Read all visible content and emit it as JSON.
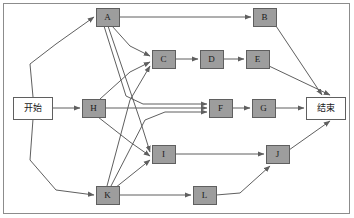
{
  "diagram": {
    "type": "directed-graph",
    "frame": {
      "x": 3,
      "y": 3,
      "width": 347,
      "height": 211,
      "stroke": "#8c8c8c",
      "fill": "#ffffff"
    },
    "style": {
      "task_fill": "#9d9d9d",
      "terminal_fill": "#ffffff",
      "node_stroke": "#5f5f5f",
      "edge_stroke": "#5f5f5f"
    },
    "nodes": [
      {
        "id": "start",
        "label": "开始",
        "kind": "terminal",
        "x": 13,
        "y": 97,
        "w": 39,
        "h": 22
      },
      {
        "id": "A",
        "label": "A",
        "kind": "task",
        "x": 96,
        "y": 8,
        "w": 23,
        "h": 18
      },
      {
        "id": "B",
        "label": "B",
        "kind": "task",
        "x": 253,
        "y": 8,
        "w": 23,
        "h": 18
      },
      {
        "id": "C",
        "label": "C",
        "kind": "task",
        "x": 152,
        "y": 50,
        "w": 23,
        "h": 18
      },
      {
        "id": "D",
        "label": "D",
        "kind": "task",
        "x": 200,
        "y": 50,
        "w": 23,
        "h": 18
      },
      {
        "id": "E",
        "label": "E",
        "kind": "task",
        "x": 246,
        "y": 50,
        "w": 23,
        "h": 18
      },
      {
        "id": "H",
        "label": "H",
        "kind": "task",
        "x": 82,
        "y": 99,
        "w": 23,
        "h": 18
      },
      {
        "id": "F",
        "label": "F",
        "kind": "task",
        "x": 209,
        "y": 99,
        "w": 23,
        "h": 18
      },
      {
        "id": "G",
        "label": "G",
        "kind": "task",
        "x": 252,
        "y": 99,
        "w": 23,
        "h": 18
      },
      {
        "id": "end",
        "label": "结束",
        "kind": "terminal",
        "x": 306,
        "y": 97,
        "w": 39,
        "h": 22
      },
      {
        "id": "I",
        "label": "I",
        "kind": "task",
        "x": 152,
        "y": 145,
        "w": 23,
        "h": 18
      },
      {
        "id": "J",
        "label": "J",
        "kind": "task",
        "x": 266,
        "y": 145,
        "w": 23,
        "h": 18
      },
      {
        "id": "K",
        "label": "K",
        "kind": "task",
        "x": 96,
        "y": 186,
        "w": 23,
        "h": 18
      },
      {
        "id": "L",
        "label": "L",
        "kind": "task",
        "x": 193,
        "y": 186,
        "w": 23,
        "h": 18
      }
    ],
    "edges": [
      {
        "id": "start-A",
        "from": "start",
        "to": "A",
        "points": "33,97 30,64 56,44 94,17"
      },
      {
        "id": "start-H",
        "from": "start",
        "to": "H",
        "points": "52,108 80,108"
      },
      {
        "id": "start-K",
        "from": "start",
        "to": "K",
        "points": "33,119 30,160 56,190 94,195"
      },
      {
        "id": "A-B",
        "from": "A",
        "to": "B",
        "points": "119,17 251,17"
      },
      {
        "id": "A-C",
        "from": "A",
        "to": "C",
        "points": "112,26 130,46 150,56"
      },
      {
        "id": "A-I",
        "from": "A",
        "to": "I",
        "points": "108,26 140,120 150,152"
      },
      {
        "id": "A-F",
        "from": "A",
        "to": "F",
        "points": "104,26 126,96 143,104 207,104"
      },
      {
        "id": "B-end",
        "from": "B",
        "to": "end",
        "points": "276,26 322,95"
      },
      {
        "id": "C-D",
        "from": "C",
        "to": "D",
        "points": "175,59 198,59"
      },
      {
        "id": "D-E",
        "from": "D",
        "to": "E",
        "points": "223,59 244,59"
      },
      {
        "id": "E-end",
        "from": "E",
        "to": "end",
        "points": "269,66 330,95"
      },
      {
        "id": "H-C",
        "from": "H",
        "to": "C",
        "points": "100,99 130,72 150,62"
      },
      {
        "id": "H-F",
        "from": "H",
        "to": "F",
        "points": "105,108 207,108"
      },
      {
        "id": "H-I",
        "from": "H",
        "to": "I",
        "points": "98,117 130,142 150,156"
      },
      {
        "id": "F-G",
        "from": "F",
        "to": "G",
        "points": "232,108 250,108"
      },
      {
        "id": "G-end",
        "from": "G",
        "to": "end",
        "points": "275,108 304,108"
      },
      {
        "id": "K-C",
        "from": "K",
        "to": "C",
        "points": "107,186 130,100 150,66"
      },
      {
        "id": "K-F",
        "from": "K",
        "to": "F",
        "points": "111,186 145,120 165,112 207,112"
      },
      {
        "id": "K-I",
        "from": "K",
        "to": "I",
        "points": "115,188 140,168 150,160"
      },
      {
        "id": "K-L",
        "from": "K",
        "to": "L",
        "points": "119,195 191,195"
      },
      {
        "id": "I-J",
        "from": "I",
        "to": "J",
        "points": "175,154 264,154"
      },
      {
        "id": "L-J",
        "from": "L",
        "to": "J",
        "points": "216,195 240,193 270,166"
      },
      {
        "id": "J-end",
        "from": "J",
        "to": "end",
        "points": "289,150 330,121"
      }
    ]
  }
}
